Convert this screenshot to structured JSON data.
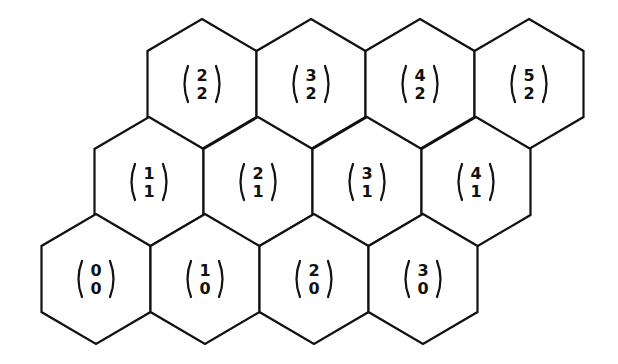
{
  "diagram": {
    "type": "hexagonal-lattice",
    "stroke_color": "#111111",
    "background_color": "#ffffff",
    "rows": [
      {
        "row_index": 2,
        "cells": [
          {
            "top": "2",
            "bottom": "2",
            "cx": 202,
            "cy": 84
          },
          {
            "top": "3",
            "bottom": "2",
            "cx": 311,
            "cy": 84
          },
          {
            "top": "4",
            "bottom": "2",
            "cx": 420,
            "cy": 84
          },
          {
            "top": "5",
            "bottom": "2",
            "cx": 529,
            "cy": 84
          }
        ]
      },
      {
        "row_index": 1,
        "cells": [
          {
            "top": "1",
            "bottom": "1",
            "cx": 149,
            "cy": 182
          },
          {
            "top": "2",
            "bottom": "1",
            "cx": 258,
            "cy": 182
          },
          {
            "top": "3",
            "bottom": "1",
            "cx": 367,
            "cy": 182
          },
          {
            "top": "4",
            "bottom": "1",
            "cx": 476,
            "cy": 182
          }
        ]
      },
      {
        "row_index": 0,
        "cells": [
          {
            "top": "0",
            "bottom": "0",
            "cx": 96,
            "cy": 279
          },
          {
            "top": "1",
            "bottom": "0",
            "cx": 205,
            "cy": 279
          },
          {
            "top": "2",
            "bottom": "0",
            "cx": 314,
            "cy": 279
          },
          {
            "top": "3",
            "bottom": "0",
            "cx": 423,
            "cy": 279
          }
        ]
      }
    ]
  }
}
